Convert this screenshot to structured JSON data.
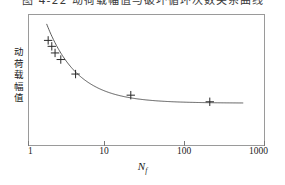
{
  "caption": {
    "text": "图 4-22 动荷载幅值与破坏循环次数关系曲线",
    "note": "cropped"
  },
  "chart_data": {
    "type": "line",
    "title": "",
    "xlabel": "N_f",
    "xlabel_main": "N",
    "xlabel_sub": "f",
    "ylabel": "动荷载幅值",
    "ylabel_chars": [
      "动",
      "荷",
      "载",
      "幅",
      "值"
    ],
    "xscale": "log",
    "yscale": "linear",
    "xlim": [
      1,
      1000
    ],
    "ylim": [
      0,
      1
    ],
    "xticks": [
      1,
      10,
      100,
      1000
    ],
    "xticklabels": [
      "1",
      "10",
      "100",
      "1000"
    ],
    "yticks": [],
    "yticklabels": [],
    "grid": false,
    "legend": null,
    "marker_style": "plus",
    "series": [
      {
        "name": "动荷载幅值",
        "x": [
          1.8,
          2.0,
          2.2,
          2.6,
          4.0,
          20,
          200
        ],
        "y": [
          0.8,
          0.755,
          0.705,
          0.655,
          0.545,
          0.385,
          0.335
        ]
      }
    ],
    "fit_curve": {
      "description": "smooth decaying curve flattening to a plateau",
      "x_start": 1.72,
      "x_end": 530
    },
    "colors": {
      "curve": "#4a4a4a",
      "marker": "#2a2a2a",
      "frame": "#9a9a9a",
      "text": "#1a1a1a"
    }
  }
}
